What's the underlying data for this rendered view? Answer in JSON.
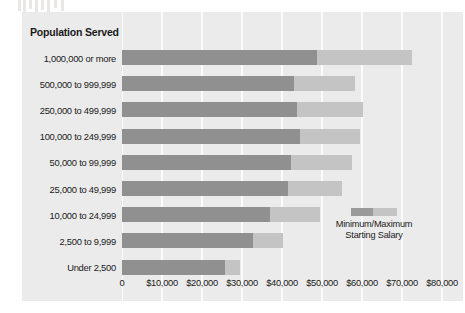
{
  "chart_data": {
    "type": "bar",
    "orientation": "horizontal",
    "subtype": "range-bar",
    "title": "",
    "xlabel": "",
    "ylabel": "Population Served",
    "xlim": [
      0,
      80000
    ],
    "xticks": [
      0,
      10000,
      20000,
      30000,
      40000,
      50000,
      60000,
      70000,
      80000
    ],
    "xticklabels": [
      "0",
      "$10,000",
      "$20,000",
      "$30,000",
      "$40,000",
      "$50,000",
      "$60,000",
      "$70,000",
      "$80,000"
    ],
    "grid": true,
    "grid_axis": "x",
    "legend_position": "inside-right-bottom",
    "legend_label": "Minimum/Maximum Starting Salary",
    "categories": [
      "1,000,000 or more",
      "500,000 to 999,999",
      "250,000 to 499,999",
      "100,000 to 249,999",
      "50,000 to 99,999",
      "25,000 to 49,999",
      "10,000 to 24,999",
      "2,500 to 9,999",
      "Under 2,500"
    ],
    "series": [
      {
        "name": "Minimum Starting Salary",
        "color": "#909090",
        "values": [
          48750,
          43000,
          43750,
          44500,
          42250,
          41500,
          37000,
          32750,
          25750
        ]
      },
      {
        "name": "Maximum Starting Salary",
        "color": "#c4c4c4",
        "values": [
          72500,
          58250,
          60250,
          59500,
          57500,
          55000,
          49500,
          40250,
          29500
        ]
      }
    ]
  },
  "legend": {
    "line1": "Minimum/Maximum",
    "line2": "Starting Salary"
  },
  "colors": {
    "panel_background": "#ebebeb",
    "gridline": "#fbfbfb",
    "bar_min": "#909090",
    "bar_max": "#c4c4c4",
    "text": "#1a1a1a"
  }
}
